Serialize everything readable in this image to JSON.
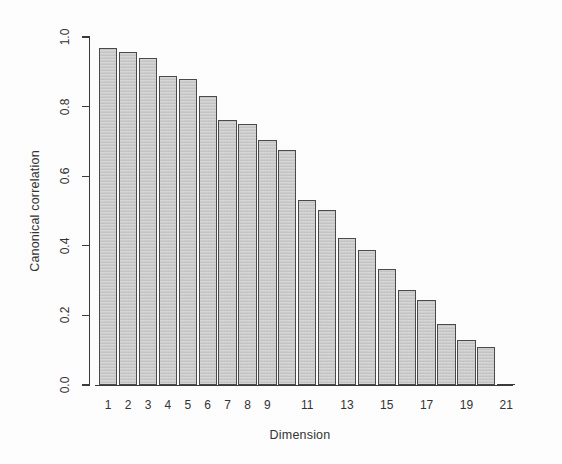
{
  "chart_data": {
    "type": "bar",
    "title": "",
    "xlabel": "Dimension",
    "ylabel": "Canonical correlation",
    "grid": false,
    "legend": null,
    "xlim": [
      0.5,
      21.5
    ],
    "ylim": [
      0.0,
      1.0
    ],
    "ytick_labels": [
      "0.0",
      "0.2",
      "0.4",
      "0.6",
      "0.8",
      "1.0"
    ],
    "ytick_values": [
      0.0,
      0.2,
      0.4,
      0.6,
      0.8,
      1.0
    ],
    "xtick_labels": [
      "1",
      "2",
      "3",
      "4",
      "5",
      "6",
      "7",
      "8",
      "9",
      "",
      "11",
      "",
      "13",
      "",
      "15",
      "",
      "17",
      "",
      "19",
      "",
      "21"
    ],
    "categories": [
      1,
      2,
      3,
      4,
      5,
      6,
      7,
      8,
      9,
      10,
      11,
      12,
      13,
      14,
      15,
      16,
      17,
      18,
      19,
      20,
      21
    ],
    "values": [
      0.968,
      0.958,
      0.94,
      0.888,
      0.878,
      0.83,
      0.762,
      0.75,
      0.705,
      0.675,
      0.532,
      0.503,
      0.423,
      0.388,
      0.332,
      0.273,
      0.244,
      0.176,
      0.13,
      0.108,
      0.004
    ],
    "bar_fill_color": "#c9c9c9",
    "bar_border_color": "#4a4a4a",
    "axis_color": "#3a3a3a",
    "background_color": "#ffffff"
  }
}
